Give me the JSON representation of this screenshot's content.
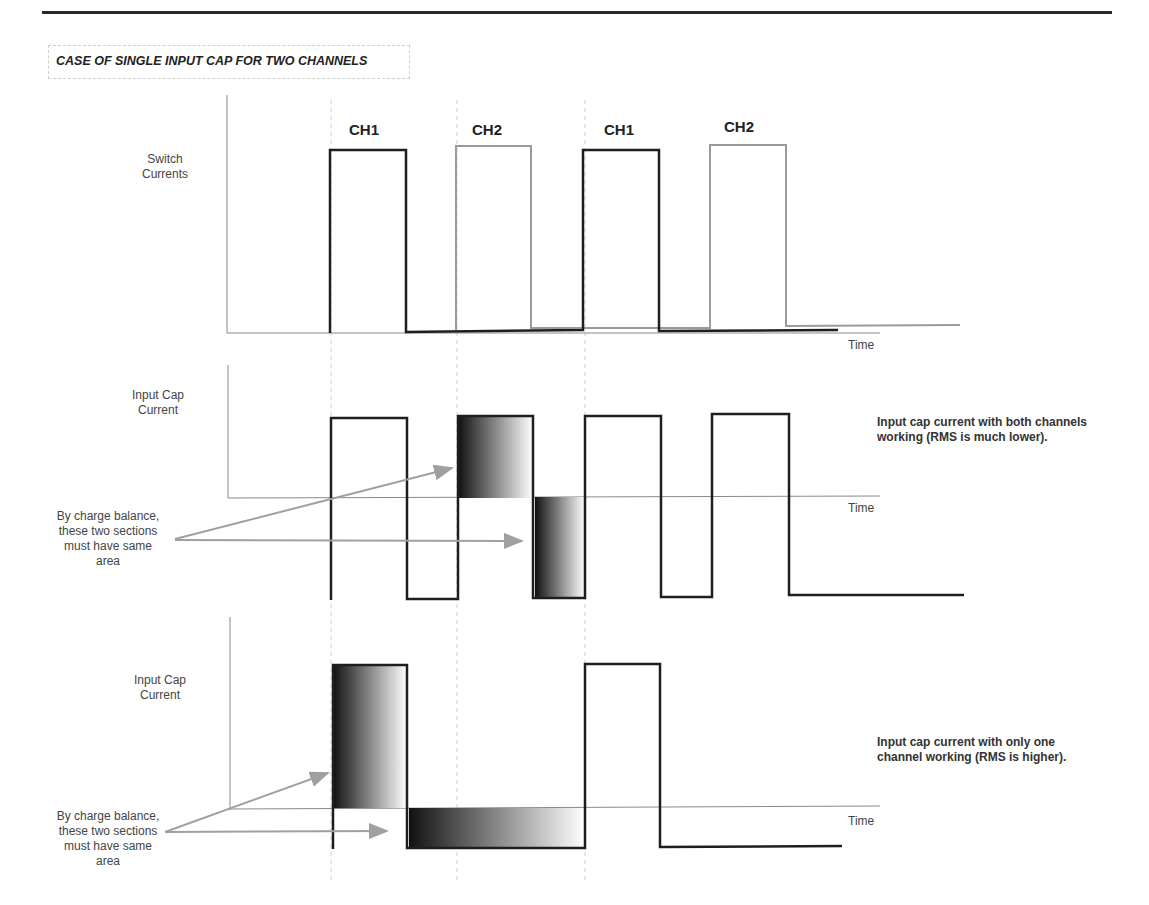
{
  "title": "CASE OF SINGLE INPUT CAP FOR TWO CHANNELS",
  "panels": {
    "switch": {
      "ylabel_line1": "Switch",
      "ylabel_line2": "Currents",
      "xlabel": "Time",
      "pulses": [
        "CH1",
        "CH2",
        "CH1",
        "CH2"
      ]
    },
    "both_channels": {
      "ylabel_line1": "Input Cap",
      "ylabel_line2": "Current",
      "xlabel": "Time",
      "note_line1": "Input cap current with both channels",
      "note_line2": "working (RMS is much lower).",
      "annotation": [
        "By charge balance,",
        "these two sections",
        "must have same",
        "area"
      ]
    },
    "one_channel": {
      "ylabel_line1": "Input Cap",
      "ylabel_line2": "Current",
      "xlabel": "Time",
      "note_line1": "Input cap current with only one",
      "note_line2": "channel working (RMS is higher).",
      "annotation": [
        "By charge balance,",
        "these two sections",
        "must have same",
        "area"
      ]
    }
  },
  "colors": {
    "ch1_line": "#1e1e1e",
    "ch2_line": "#9a9a9a",
    "axis": "#8a8a8a",
    "arrow": "#a0a0a0"
  }
}
